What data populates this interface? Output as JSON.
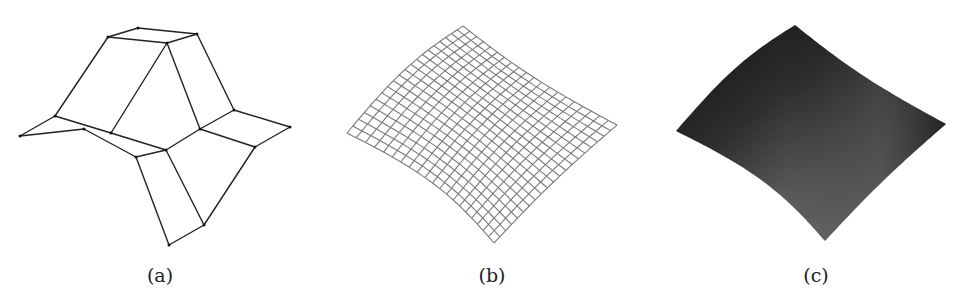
{
  "figure": {
    "panels": [
      {
        "id": "a",
        "caption": "(a)",
        "caption_x": 160,
        "kind": "wireframe-control-net",
        "description": "Coarse control polyhedron (black line wireframe) of a surface",
        "stroke_color": "#222222",
        "vertices": {
          "t1": [
            138,
            28
          ],
          "t2": [
            197,
            34
          ],
          "t3": [
            108,
            37
          ],
          "t4": [
            167,
            43
          ],
          "l1": [
            55,
            116
          ],
          "l2": [
            20,
            136
          ],
          "l3": [
            84,
            129
          ],
          "l4": [
            111,
            133
          ],
          "c1": [
            136,
            157
          ],
          "c2": [
            166,
            150
          ],
          "c3": [
            200,
            129
          ],
          "c4": [
            234,
            110
          ],
          "r1": [
            290,
            127
          ],
          "r2": [
            255,
            147
          ],
          "b1": [
            169,
            245
          ],
          "b2": [
            204,
            225
          ]
        },
        "edges": [
          [
            "t3",
            "t1"
          ],
          [
            "t1",
            "t2"
          ],
          [
            "t3",
            "t4"
          ],
          [
            "t4",
            "t2"
          ],
          [
            "t3",
            "l1"
          ],
          [
            "t4",
            "l4"
          ],
          [
            "t4",
            "c3"
          ],
          [
            "t2",
            "c4"
          ],
          [
            "l1",
            "l2"
          ],
          [
            "l2",
            "l3"
          ],
          [
            "l1",
            "l4"
          ],
          [
            "l4",
            "c2"
          ],
          [
            "l3",
            "c1"
          ],
          [
            "c1",
            "c2"
          ],
          [
            "c2",
            "c3"
          ],
          [
            "c3",
            "c4"
          ],
          [
            "c4",
            "r1"
          ],
          [
            "r1",
            "r2"
          ],
          [
            "c3",
            "r2"
          ],
          [
            "c1",
            "b1"
          ],
          [
            "c2",
            "b2"
          ],
          [
            "b1",
            "b2"
          ],
          [
            "r2",
            "b2"
          ]
        ]
      },
      {
        "id": "b",
        "caption": "(b)",
        "caption_x": 492,
        "kind": "wireframe-mesh",
        "description": "Subdivided smooth surface shown as a dense quad mesh",
        "stroke_color": "#7a7a7a",
        "grid_lines": 20,
        "corners": {
          "top": [
            463,
            26
          ],
          "left": [
            347,
            133
          ],
          "right": [
            617,
            125
          ],
          "bottom": [
            494,
            243
          ]
        }
      },
      {
        "id": "c",
        "caption": "(c)",
        "caption_x": 816,
        "kind": "shaded-surface",
        "description": "Smooth shaded rendering of the same surface",
        "colors": {
          "dark": "#1c1c1c",
          "mid": "#4a4a4a",
          "light": "#8a8a8a"
        },
        "corners": {
          "top": [
            795,
            25
          ],
          "left": [
            676,
            131
          ],
          "right": [
            946,
            124
          ],
          "bottom": [
            825,
            241
          ]
        }
      }
    ]
  }
}
